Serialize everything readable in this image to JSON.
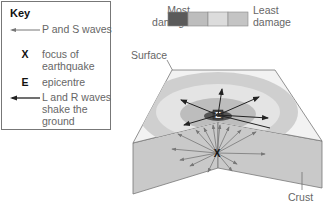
{
  "key": {
    "title": "Key",
    "items": [
      {
        "symbol": "arrow-thin",
        "label": "P and S waves"
      },
      {
        "symbol": "X",
        "label": "focus of earthquake"
      },
      {
        "symbol": "E",
        "label": "epicentre"
      },
      {
        "symbol": "arrow-thick",
        "label": "L and R waves shake the ground"
      }
    ]
  },
  "damage_legend": {
    "left_label": "Most damage",
    "right_label": "Least damage",
    "swatches": [
      "#5a5a5a",
      "#bdbdbd",
      "#dcdcdc",
      "#c4c4c4"
    ]
  },
  "labels": {
    "surface": "Surface",
    "crust": "Crust",
    "epicentre_marker": "E",
    "focus_marker": "X"
  },
  "colors": {
    "surface_face": "#f2f2f2",
    "crust_face": "#c9c9c9",
    "outer_ring": "#cfcfcf",
    "mid_ring": "#e4e4e4",
    "inner_ring": "#bdbdbd",
    "center": "#555555"
  }
}
